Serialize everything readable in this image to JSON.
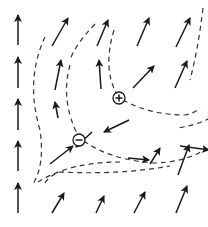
{
  "diagram": {
    "charges": [
      {
        "sign": "+",
        "label": "positive-charge",
        "x": 119,
        "y": 98
      },
      {
        "sign": "-",
        "label": "negative-charge",
        "x": 79,
        "y": 140
      }
    ],
    "arrows": [
      [
        18,
        45,
        18,
        15
      ],
      [
        18,
        88,
        18,
        57
      ],
      [
        18,
        130,
        18,
        99
      ],
      [
        18,
        171,
        18,
        141
      ],
      [
        18,
        213,
        18,
        183
      ],
      [
        52,
        46,
        68,
        18
      ],
      [
        55,
        90,
        61,
        60
      ],
      [
        58,
        118,
        55,
        102
      ],
      [
        50,
        164,
        73,
        146
      ],
      [
        52,
        213,
        64,
        193
      ],
      [
        97,
        46,
        108,
        20
      ],
      [
        101,
        89,
        99,
        60
      ],
      [
        92,
        132,
        76,
        147
      ],
      [
        96,
        213,
        104,
        196
      ],
      [
        137,
        46,
        149,
        18
      ],
      [
        133,
        88,
        154,
        66
      ],
      [
        129,
        120,
        104,
        132
      ],
      [
        128,
        158,
        149,
        160
      ],
      [
        134,
        213,
        145,
        192
      ],
      [
        176,
        47,
        190,
        18
      ],
      [
        175,
        88,
        187,
        61
      ],
      [
        180,
        146,
        209,
        150
      ],
      [
        176,
        213,
        187,
        186
      ],
      [
        150,
        164,
        160,
        148
      ],
      [
        178,
        175,
        189,
        145
      ]
    ],
    "field_lines": [
      "M 45 37 Q 25 80 40 130 Q 45 165 33 184",
      "M 70 65 Q 63 90 70 115 Q 74 130 80 137",
      "M 95 24 Q 75 45 70 60",
      "M 114 30 Q 102 70 118 96",
      "M 123 100 Q 150 115 185 115 Q 195 113 200 108",
      "M 84 141 Q 110 160 155 163 Q 185 162 204 150",
      "M 38 182 Q 70 162 120 162",
      "M 45 183 Q 50 175 60 172 Q 120 175 170 166",
      "M 210 118 Q 195 126 176 128",
      "M 203 8 Q 198 50 190 80"
    ]
  }
}
